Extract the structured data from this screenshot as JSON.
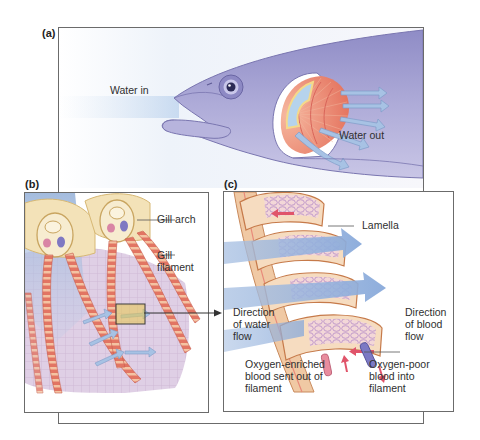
{
  "figure": {
    "panels": [
      {
        "id": "a",
        "label": "(a)",
        "description": "Fish head with cutaway of operculum showing gills",
        "labels": {
          "water_in": "Water in",
          "water_out": "Water out"
        }
      },
      {
        "id": "b",
        "label": "(b)",
        "description": "Gill arches with gill filaments",
        "labels": {
          "gill_arch": "Gill arch",
          "gill_filament": "Gill\nfilament"
        }
      },
      {
        "id": "c",
        "label": "(c)",
        "description": "Lamellae of a gill filament showing countercurrent exchange",
        "labels": {
          "lamella": "Lamella",
          "direction_water_flow": "Direction\nof water\nflow",
          "direction_blood_flow": "Direction\nof blood\nflow",
          "oxygen_enriched": "Oxygen-enriched\nblood sent out of\nfilament",
          "oxygen_poor": "Oxygen-poor\nblood into\nfilament"
        }
      }
    ],
    "colors": {
      "fish_body": "#a9a6d4",
      "fish_dark": "#8c88c2",
      "gill_red": "#e8826e",
      "gill_stripe": "#f3c6a4",
      "water_blue": "#9fbde0",
      "arch_cream": "#f3e2b8",
      "frame": "#6b6b6b",
      "highlight_box": "#e8c84a"
    }
  }
}
